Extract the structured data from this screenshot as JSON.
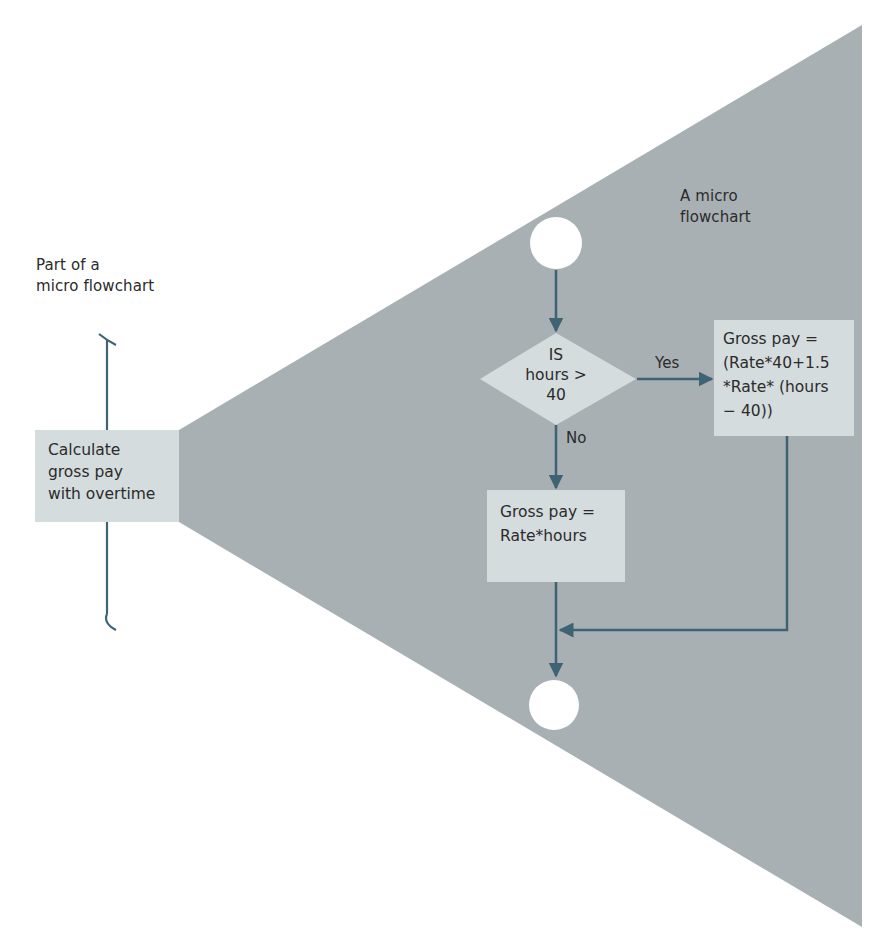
{
  "colors": {
    "wedge": "#a8b0b3",
    "box_fill": "#d5dcdd",
    "line": "#3d6375",
    "circle": "#ffffff",
    "text": "#2b2b2b"
  },
  "left_panel": {
    "caption_line1": "Part of a",
    "caption_line2": "micro flowchart",
    "process_box": {
      "line1": "Calculate",
      "line2": "gross pay",
      "line3": "with overtime"
    }
  },
  "micro_flowchart": {
    "caption_line1": "A micro",
    "caption_line2": "flowchart",
    "start_terminal": "circle",
    "decision": {
      "line1": "IS",
      "line2": "hours >",
      "line3": "40"
    },
    "yes_label": "Yes",
    "no_label": "No",
    "overtime_box": {
      "line1": "Gross pay =",
      "line2": "(Rate*40+1.5",
      "line3": "*Rate* (hours",
      "line4": "− 40))"
    },
    "regular_box": {
      "line1": "Gross pay =",
      "line2": "Rate*hours"
    },
    "end_terminal": "circle"
  }
}
